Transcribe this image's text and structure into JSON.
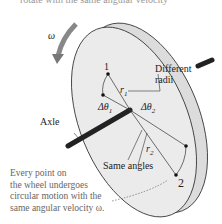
{
  "top_caption": "rotate with the same angular velocity",
  "labels": {
    "omega": "ω",
    "point1": "1",
    "point2": "2",
    "r1": "r",
    "r1_sub": "1",
    "r2": "r",
    "r2_sub": "2",
    "dtheta1": "Δθ",
    "dtheta1_sub": "1",
    "dtheta2": "Δθ",
    "dtheta2_sub": "2",
    "different_radii_1": "Different",
    "different_radii_2": "radii",
    "axle": "Axle",
    "same_angles": "Same angles"
  },
  "caption": {
    "line1": "Every point on",
    "line2": "the wheel undergoes",
    "line3": "circular motion with the",
    "line4": "same angular velocity ω."
  },
  "colors": {
    "wheel_face": "#e9e9ea",
    "wheel_rim": "#dcdcdd",
    "arrow": "#7a7a7a",
    "axle": "#222222"
  }
}
